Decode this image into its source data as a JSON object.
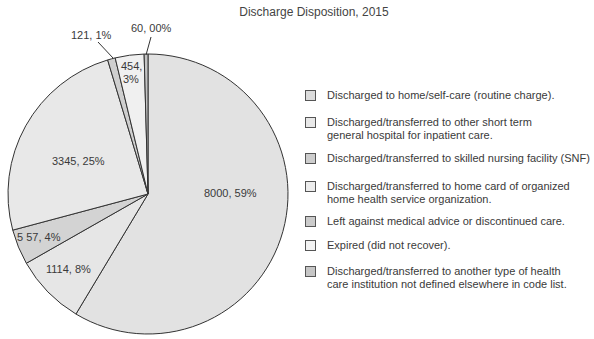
{
  "chart_data": {
    "type": "pie",
    "title": "Discharge Disposition, 2015",
    "xlabel": "",
    "ylabel": "",
    "grid": false,
    "legend_position": "right",
    "categories": [
      "Discharged to home/self-care (routine charge).",
      "Discharged/transferred to other short term general hospital for inpatient care.",
      "Discharged/transferred to skilled nursing facility (SNF)",
      "Discharged/transferred to home card of organized home health service organization.",
      "Left against medical advice or discontinued care.",
      "Expired (did not recover).",
      "Discharged/transferred to another type of health care institution not defined elsewhere in code list."
    ],
    "values": [
      8000,
      3345,
      557,
      1114,
      121,
      454,
      60
    ],
    "data_labels": [
      "8000, 59%",
      "3345, 25%",
      "5 57, 4%",
      "1114, 8%",
      "121, 1%",
      "454,\n3%",
      "60, 00%"
    ]
  },
  "title": "Discharge Disposition, 2015",
  "slices": [
    {
      "name": "home-self-care",
      "value": 8000,
      "label": "8000, 59%",
      "color": "#e2e2e2"
    },
    {
      "name": "home-health",
      "value": 1114,
      "label": "1114, 8%",
      "color": "#e6e6e6"
    },
    {
      "name": "snf",
      "value": 557,
      "label": "5 57, 4%",
      "color": "#d3d3d3"
    },
    {
      "name": "short-term-hospital",
      "value": 3345,
      "label": "3345, 25%",
      "color": "#e8e8e8"
    },
    {
      "name": "left-ama",
      "value": 121,
      "label": "121, 1%",
      "color": "#cfcfcf"
    },
    {
      "name": "expired",
      "value": 454,
      "label": "454,",
      "label2": "3%",
      "color": "#f0f0f0"
    },
    {
      "name": "other-institution",
      "value": 60,
      "label": "60, 00%",
      "color": "#c4c4c4"
    }
  ],
  "legend": [
    {
      "text": "Discharged to home/self-care (routine charge).",
      "color": "#dcdcdc"
    },
    {
      "text": "Discharged/transferred to other short term\ngeneral hospital for inpatient care.",
      "color": "#e8e8e8"
    },
    {
      "text": "Discharged/transferred to skilled nursing facility (SNF)",
      "color": "#cdcdcd"
    },
    {
      "text": "Discharged/transferred to home card of organized\nhome health service organization.",
      "color": "#ececec"
    },
    {
      "text": "Left against medical advice or discontinued care.",
      "color": "#cbcbcb"
    },
    {
      "text": "Expired (did not recover).",
      "color": "#f3f3f3"
    },
    {
      "text": "Discharged/transferred to another type of health\ncare institution not defined elsewhere in code list.",
      "color": "#c6c6c6"
    }
  ]
}
